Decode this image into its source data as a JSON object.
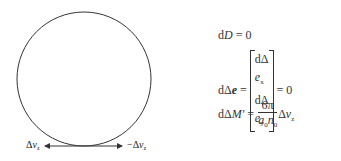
{
  "diagram": {
    "circle": {
      "cx": 84,
      "cy": 79,
      "r": 67,
      "stroke": "#333333"
    },
    "arrow": {
      "y": 146,
      "x_left": 45,
      "x_right": 122
    },
    "labels": {
      "left": {
        "delta": "Δ",
        "var": "v",
        "sub": "z"
      },
      "right": {
        "delta": "−Δ",
        "var": "v",
        "sub": "z"
      }
    }
  },
  "equations": {
    "eq1": {
      "lhs_d": "d",
      "lhs_var": "D",
      "rhs": " = 0"
    },
    "eq2": {
      "lhs_d": "dΔ",
      "lhs_var": "e",
      "eq": " = ",
      "row1": {
        "d": "dΔ",
        "var": "e",
        "sub": "x"
      },
      "row2": {
        "d": "dΔ",
        "var": "e",
        "sub": "y"
      },
      "rhs": " = 0"
    },
    "eq3": {
      "lhs_d": "dΔ",
      "lhs_var": "M′",
      "eq": " = ",
      "num": "6π",
      "den": {
        "a": "a",
        "a_sub": "0",
        "n": "n",
        "n_sub": "0"
      },
      "tail_delta": "Δ",
      "tail_var": "v",
      "tail_sub": "z"
    }
  }
}
